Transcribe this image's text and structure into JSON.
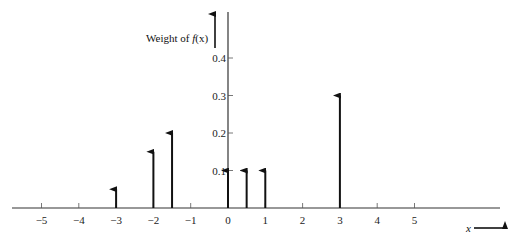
{
  "chart_data": {
    "type": "bar",
    "subtype": "impulse/stem (probability mass function)",
    "title": "",
    "ylabel": "Weight of f(x)",
    "xlabel": "x",
    "x": [
      -3,
      -2,
      -1.5,
      0,
      0.5,
      1,
      3
    ],
    "values": [
      0.05,
      0.15,
      0.2,
      0.1,
      0.1,
      0.1,
      0.3
    ],
    "xlim": [
      -5.8,
      7.4
    ],
    "ylim": [
      0,
      0.52
    ],
    "x_ticks": [
      -5,
      -4,
      -3,
      -2,
      -1,
      0,
      1,
      2,
      3,
      4,
      5
    ],
    "x_tick_labels": [
      "−5",
      "−4",
      "−3",
      "−2",
      "−1",
      "0",
      "1",
      "2",
      "3",
      "4",
      "5"
    ],
    "y_ticks": [
      0.1,
      0.2,
      0.3,
      0.4
    ],
    "y_tick_labels": [
      "0.1",
      "0.2",
      "0.3",
      "0.4"
    ],
    "grid": false,
    "legend": null,
    "colors": {
      "stem": "#111111",
      "axis": "#333333"
    }
  },
  "labels": {
    "ylabel_prefix": "Weight of ",
    "ylabel_func": "f",
    "ylabel_arg": "(x)",
    "xlabel": "x"
  }
}
